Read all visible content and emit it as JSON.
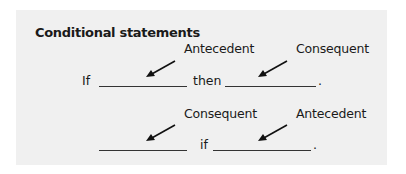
{
  "title": "Conditional statements",
  "row1": {
    "label_left": "Antecedent",
    "label_right": "Consequent",
    "lead_word": "If",
    "middle_word": "then",
    "end_punct": "."
  },
  "row2": {
    "label_left": "Consequent",
    "label_right": "Antecedent",
    "middle_word": "if",
    "end_punct": "."
  },
  "colors": {
    "panel_bg": "#f0f0f0",
    "text": "#1a1a1a"
  }
}
